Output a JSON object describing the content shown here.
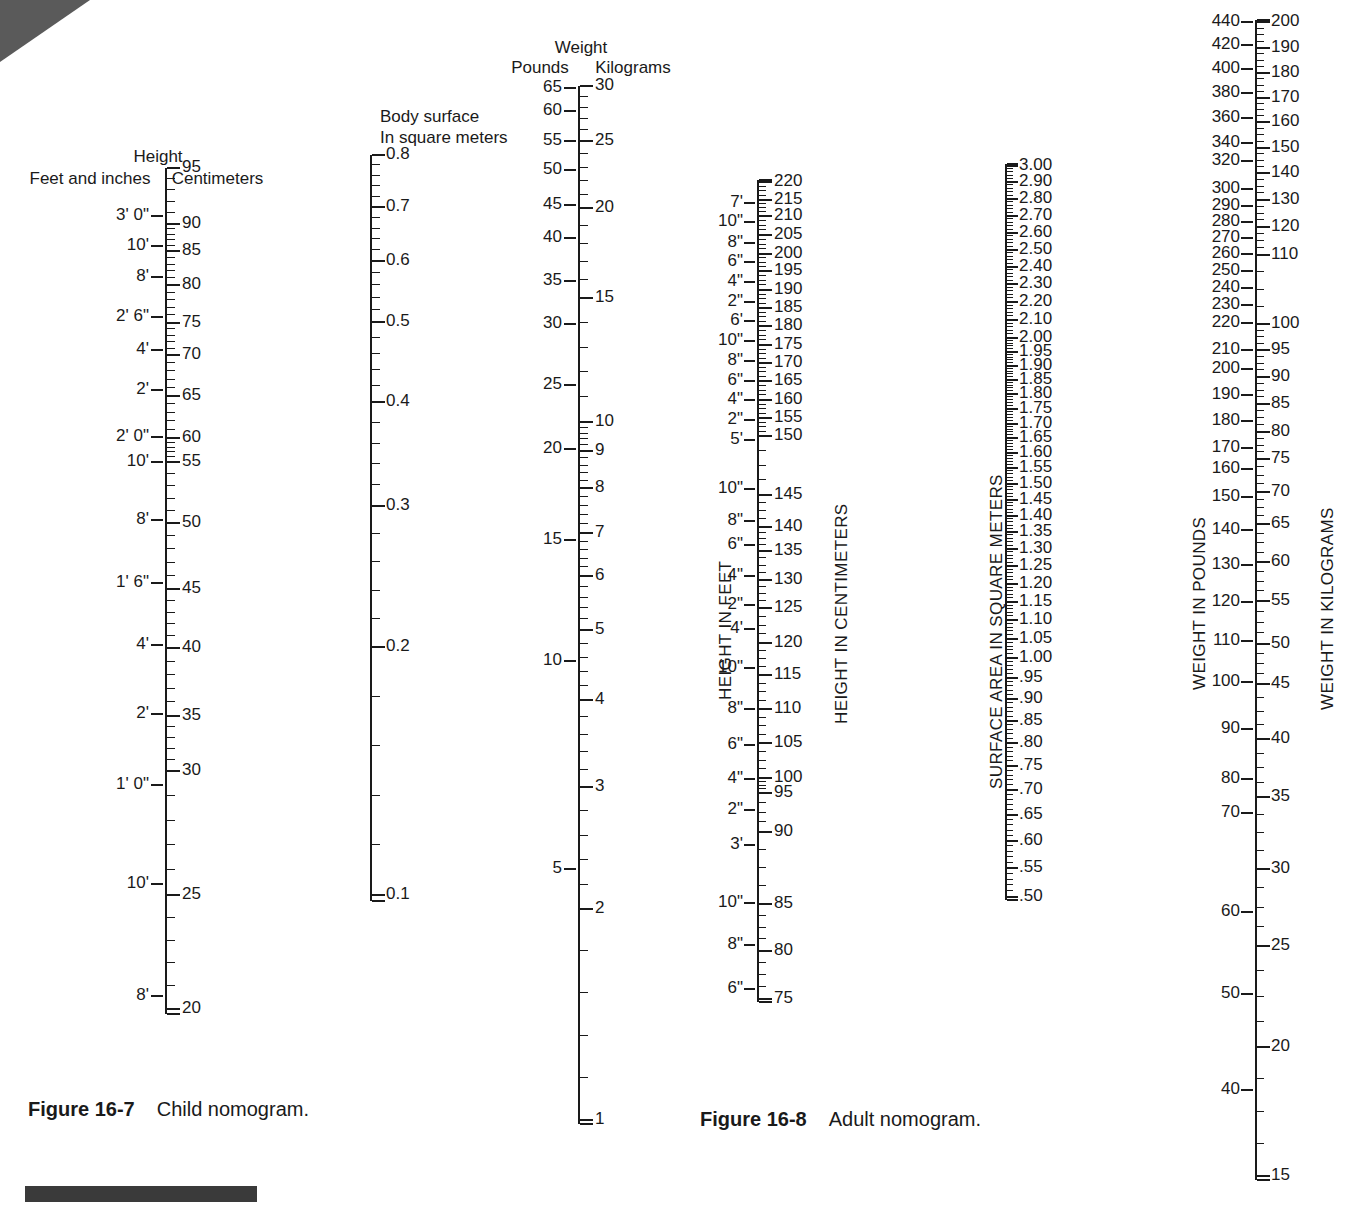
{
  "figure_child": {
    "caption_label": "Figure 16-7",
    "caption_text": "Child nomogram.",
    "height_title": "Height",
    "height_left_header": "Feet and inches",
    "height_right_header": "Centimeters",
    "bsa_header_line1": "Body surface",
    "bsa_header_line2": "In square meters",
    "weight_title": "Weight",
    "weight_left_header": "Pounds",
    "weight_right_header": "Kilograms"
  },
  "figure_adult": {
    "caption_label": "Figure 16-8",
    "caption_text": "Adult nomogram.",
    "height_left_axis_title": "HEIGHT IN FEET",
    "height_right_axis_title": "HEIGHT IN CENTIMETERS",
    "bsa_axis_title": "SURFACE AREA IN SQUARE METERS",
    "weight_left_axis_title": "WEIGHT IN POUNDS",
    "weight_right_axis_title": "WEIGHT IN KILOGRAMS"
  },
  "chart_data": {
    "type": "table",
    "scales": [
      {
        "id": "child-height-feet",
        "name": "Child height — feet and inches",
        "side": "left",
        "unit": "feet and inches",
        "labels": [
          "3' 0\"",
          "10'",
          "8'",
          "2' 6\"",
          "4'",
          "2'",
          "2' 0\"",
          "10'",
          "8'",
          "1' 6\"",
          "4'",
          "2'",
          "1' 0\"",
          "10'",
          "8'"
        ],
        "positions": [
          216,
          246,
          277,
          317,
          350,
          390,
          437,
          462,
          520,
          583,
          645,
          714,
          785,
          884,
          996
        ]
      },
      {
        "id": "child-height-cm",
        "name": "Child height — centimeters",
        "side": "right",
        "unit": "centimeters",
        "labels": [
          "95",
          "90",
          "85",
          "80",
          "75",
          "70",
          "65",
          "60",
          "55",
          "50",
          "45",
          "40",
          "35",
          "30",
          "25",
          "20"
        ],
        "positions": [
          168,
          224,
          251,
          285,
          323,
          355,
          396,
          438,
          462,
          523,
          589,
          648,
          716,
          771,
          895,
          1009
        ],
        "minor_ticks_per_major": 5
      },
      {
        "id": "child-bsa",
        "name": "Child body surface area",
        "side": "right",
        "unit": "square meters",
        "labels": [
          "0.8",
          "0.7",
          "0.6",
          "0.5",
          "0.4",
          "0.3",
          "0.2",
          "0.1"
        ],
        "positions": [
          155,
          207,
          261,
          322,
          402,
          506,
          647,
          895
        ]
      },
      {
        "id": "child-weight-lb",
        "name": "Child weight — pounds",
        "side": "left",
        "unit": "pounds",
        "labels": [
          "65",
          "60",
          "55",
          "50",
          "45",
          "40",
          "35",
          "30",
          "25",
          "20",
          "15",
          "10",
          "5"
        ],
        "positions": [
          88,
          111,
          141,
          170,
          205,
          238,
          281,
          324,
          385,
          449,
          540,
          661,
          869
        ]
      },
      {
        "id": "child-weight-kg",
        "name": "Child weight — kilograms",
        "side": "right",
        "unit": "kilograms",
        "labels": [
          "30",
          "25",
          "20",
          "15",
          "10",
          "9",
          "8",
          "7",
          "6",
          "5",
          "4",
          "3",
          "2",
          "1"
        ],
        "positions": [
          86,
          141,
          208,
          298,
          422,
          451,
          488,
          533,
          576,
          630,
          700,
          787,
          909,
          1120
        ]
      },
      {
        "id": "adult-height-feet",
        "name": "Adult height — feet and inches",
        "side": "left",
        "unit": "feet and inches",
        "labels": [
          "7'",
          "10\"",
          "8\"",
          "6\"",
          "4\"",
          "2\"",
          "6'",
          "10\"",
          "8\"",
          "6\"",
          "4\"",
          "2\"",
          "5'",
          "10\"",
          "8\"",
          "6\"",
          "4\"",
          "2\"",
          "4'",
          "10\"",
          "8\"",
          "6\"",
          "4\"",
          "2\"",
          "3'",
          "10\"",
          "8\"",
          "6\""
        ],
        "positions": [
          203,
          222,
          243,
          262,
          282,
          302,
          321,
          341,
          361,
          381,
          400,
          420,
          440,
          489,
          521,
          545,
          576,
          605,
          629,
          668,
          709,
          745,
          779,
          810,
          845,
          903,
          945,
          989
        ]
      },
      {
        "id": "adult-height-cm",
        "name": "Adult height — centimeters",
        "side": "right",
        "unit": "centimeters",
        "labels": [
          "220",
          "215",
          "210",
          "205",
          "200",
          "195",
          "190",
          "185",
          "180",
          "175",
          "170",
          "165",
          "160",
          "155",
          "150",
          "145",
          "140",
          "135",
          "130",
          "125",
          "120",
          "115",
          "110",
          "105",
          "100",
          "95",
          "90",
          "85",
          "80",
          "75"
        ],
        "positions": [
          182,
          200,
          216,
          235,
          254,
          271,
          290,
          308,
          326,
          345,
          363,
          381,
          400,
          418,
          436,
          495,
          527,
          551,
          580,
          608,
          643,
          675,
          709,
          743,
          778,
          793,
          832,
          904,
          951,
          999
        ]
      },
      {
        "id": "adult-bsa",
        "name": "Adult surface area",
        "side": "right",
        "unit": "square meters",
        "labels": [
          "3.00",
          "2.90",
          "2.80",
          "2.70",
          "2.60",
          "2.50",
          "2.40",
          "2.30",
          "2.20",
          "2.10",
          "2.00",
          "1.95",
          "1.90",
          "1.85",
          "1.80",
          "1.75",
          "1.70",
          "1.65",
          "1.60",
          "1.55",
          "1.50",
          "1.45",
          "1.40",
          "1.35",
          "1.30",
          "1.25",
          "1.20",
          "1.15",
          "1.10",
          "1.05",
          "1.00",
          ".95",
          ".90",
          ".85",
          ".80",
          ".75",
          ".70",
          ".65",
          ".60",
          ".55",
          ".50"
        ],
        "positions": [
          166,
          182,
          199,
          216,
          233,
          250,
          267,
          284,
          302,
          320,
          338,
          352,
          366,
          380,
          394,
          409,
          424,
          438,
          453,
          468,
          484,
          500,
          516,
          532,
          549,
          566,
          584,
          602,
          620,
          639,
          658,
          678,
          699,
          721,
          743,
          766,
          790,
          815,
          841,
          868,
          897
        ]
      },
      {
        "id": "adult-weight-lb",
        "name": "Adult weight — pounds",
        "side": "left",
        "unit": "pounds",
        "labels": [
          "440",
          "420",
          "400",
          "380",
          "360",
          "340",
          "320",
          "300",
          "290",
          "280",
          "270",
          "260",
          "250",
          "240",
          "230",
          "220",
          "210",
          "200",
          "190",
          "180",
          "170",
          "160",
          "150",
          "140",
          "130",
          "120",
          "110",
          "100",
          "90",
          "80",
          "70",
          "60",
          "50",
          "40"
        ],
        "positions": [
          22,
          45,
          69,
          93,
          118,
          143,
          161,
          189,
          206,
          222,
          238,
          254,
          271,
          288,
          305,
          323,
          350,
          369,
          395,
          421,
          448,
          469,
          497,
          530,
          565,
          602,
          641,
          682,
          729,
          779,
          813,
          912,
          994,
          1090
        ]
      },
      {
        "id": "adult-weight-kg",
        "name": "Adult weight — kilograms",
        "side": "right",
        "unit": "kilograms",
        "labels": [
          "200",
          "190",
          "180",
          "170",
          "160",
          "150",
          "140",
          "130",
          "120",
          "110",
          "100",
          "95",
          "90",
          "85",
          "80",
          "75",
          "70",
          "65",
          "60",
          "55",
          "50",
          "45",
          "40",
          "35",
          "30",
          "25",
          "20",
          "15"
        ],
        "positions": [
          22,
          48,
          73,
          98,
          122,
          148,
          173,
          200,
          227,
          255,
          324,
          350,
          377,
          404,
          432,
          459,
          492,
          524,
          562,
          601,
          644,
          684,
          739,
          797,
          869,
          946,
          1047,
          1176
        ]
      }
    ]
  }
}
